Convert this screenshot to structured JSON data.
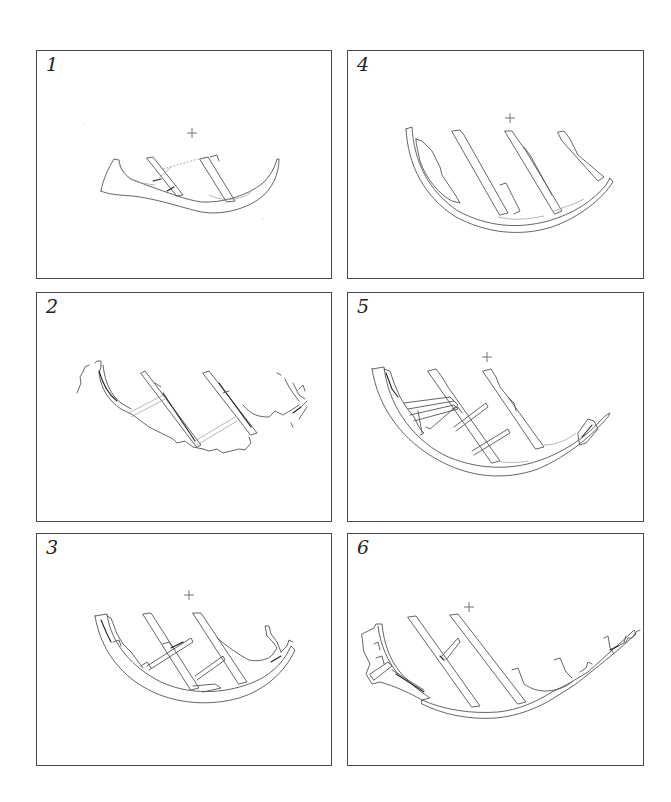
{
  "figure": {
    "type": "hull cross-section drawings",
    "panel_count": 6,
    "layout": "3 rows x 2 columns",
    "panels": [
      {
        "id": "1",
        "label": "1",
        "position": "row-1-left",
        "has_centerline_mark": true,
        "frames_visible": 2
      },
      {
        "id": "4",
        "label": "4",
        "position": "row-1-right",
        "has_centerline_mark": true,
        "frames_visible": 3
      },
      {
        "id": "2",
        "label": "2",
        "position": "row-2-left",
        "has_centerline_mark": false,
        "frames_visible": 2
      },
      {
        "id": "5",
        "label": "5",
        "position": "row-2-right",
        "has_centerline_mark": true,
        "frames_visible": 2
      },
      {
        "id": "3",
        "label": "3",
        "position": "row-3-left",
        "has_centerline_mark": true,
        "frames_visible": 2
      },
      {
        "id": "6",
        "label": "6",
        "position": "row-3-right",
        "has_centerline_mark": true,
        "frames_visible": 2
      }
    ]
  },
  "colors": {
    "background": "#ffffff",
    "frame_border": "#4a4a4a",
    "line_art": "#555555",
    "label": "#222222"
  },
  "centerline_symbol": "+"
}
